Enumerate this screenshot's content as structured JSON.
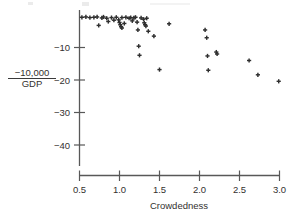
{
  "figure": {
    "background": "#ffffff",
    "ink_color": "#3a3a3a",
    "marker_color": "#2f2f2f",
    "marker_symbol": "plus"
  },
  "y_axis": {
    "label_numerator": "−10,000",
    "label_denominator": "GDP",
    "ticks": [
      "−10",
      "−20",
      "−30",
      "−40"
    ],
    "tick_values": [
      -10,
      -20,
      -30,
      -40
    ],
    "range": [
      -45,
      0
    ]
  },
  "x_axis": {
    "label": "Crowdedness",
    "ticks": [
      "0.5",
      "1.0",
      "1.5",
      "2.0",
      "2.5",
      "3.0"
    ],
    "tick_values": [
      0.5,
      1.0,
      1.5,
      2.0,
      2.5,
      3.0
    ],
    "range": [
      0.45,
      3.05
    ]
  },
  "chart_data": {
    "type": "scatter",
    "title": "",
    "xlabel": "Crowdedness",
    "ylabel": "-10,000 / GDP",
    "xlim": [
      0.45,
      3.05
    ],
    "ylim": [
      -45,
      0
    ],
    "grid": false,
    "legend": null,
    "marker": "+",
    "points": [
      [
        0.53,
        -0.7
      ],
      [
        0.58,
        -0.6
      ],
      [
        0.63,
        -0.8
      ],
      [
        0.68,
        -0.7
      ],
      [
        0.72,
        -0.6
      ],
      [
        0.74,
        -3.2
      ],
      [
        0.78,
        -0.9
      ],
      [
        0.8,
        -0.6
      ],
      [
        0.84,
        -1.0
      ],
      [
        0.86,
        -2.0
      ],
      [
        0.9,
        -0.8
      ],
      [
        0.93,
        -1.6
      ],
      [
        0.96,
        -0.7
      ],
      [
        0.99,
        -1.5
      ],
      [
        1.0,
        -2.3
      ],
      [
        1.01,
        -3.0
      ],
      [
        1.02,
        -3.6
      ],
      [
        1.03,
        -4.0
      ],
      [
        1.03,
        -0.8
      ],
      [
        1.06,
        -2.6
      ],
      [
        1.08,
        -0.7
      ],
      [
        1.12,
        -1.0
      ],
      [
        1.14,
        -0.8
      ],
      [
        1.16,
        -1.8
      ],
      [
        1.18,
        -0.9
      ],
      [
        1.2,
        -0.7
      ],
      [
        1.22,
        -2.2
      ],
      [
        1.23,
        -4.6
      ],
      [
        1.24,
        -9.6
      ],
      [
        1.25,
        -12.4
      ],
      [
        1.27,
        -0.9
      ],
      [
        1.3,
        -1.3
      ],
      [
        1.31,
        -2.4
      ],
      [
        1.32,
        -3.0
      ],
      [
        1.33,
        -3.4
      ],
      [
        1.34,
        -1.0
      ],
      [
        1.36,
        -5.0
      ],
      [
        1.43,
        -6.5
      ],
      [
        1.5,
        -16.8
      ],
      [
        1.62,
        -2.7
      ],
      [
        2.07,
        -4.6
      ],
      [
        2.09,
        -7.0
      ],
      [
        2.1,
        -12.6
      ],
      [
        2.11,
        -17.0
      ],
      [
        2.21,
        -11.4
      ],
      [
        2.22,
        -12.0
      ],
      [
        2.62,
        -14.0
      ],
      [
        2.73,
        -18.4
      ],
      [
        2.99,
        -20.4
      ]
    ]
  }
}
